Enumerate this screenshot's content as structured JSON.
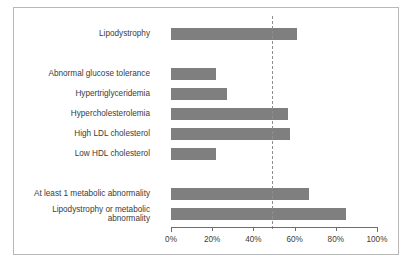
{
  "chart_data": {
    "type": "bar",
    "orientation": "horizontal",
    "title": "",
    "subtitle": "",
    "xlabel": "",
    "ylabel": "",
    "xlim": [
      0,
      100
    ],
    "grid": false,
    "legend": null,
    "units": "percent",
    "categories": [
      "Lipodystrophy",
      "Abnormal glucose tolerance",
      "Hypertriglyceridemia",
      "Hypercholesterolemia",
      "High LDL cholesterol",
      "Low HDL cholesterol",
      "At least 1 metabolic abnormality",
      "Lipodystrophy or metabolic abnormality"
    ],
    "values": [
      61,
      22,
      27,
      57,
      58,
      22,
      67,
      85
    ],
    "tick_labels": [
      "0%",
      "20%",
      "40%",
      "60%",
      "80%",
      "100%"
    ],
    "tick_values": [
      0,
      20,
      40,
      60,
      80,
      100
    ],
    "annotations": [
      {
        "name": "reference-line",
        "type": "vertical-dashed-line",
        "value": 49
      }
    ],
    "colors": {
      "bar": "#7f7f7f",
      "reference_line": "#8e8e8e",
      "axis": "#6e6e6e",
      "text": "#3b3b3b",
      "border": "#b8b8b8",
      "background": "#ffffff"
    }
  },
  "bars": [
    {
      "label": "Lipodystrophy",
      "value": 61,
      "group": 1
    },
    {
      "label": "Abnormal glucose tolerance",
      "value": 22,
      "group": 2
    },
    {
      "label": "Hypertriglyceridemia",
      "value": 27,
      "group": 2
    },
    {
      "label": "Hypercholesterolemia",
      "value": 57,
      "group": 2
    },
    {
      "label": "High LDL cholesterol",
      "value": 58,
      "group": 2
    },
    {
      "label": "Low HDL cholesterol",
      "value": 22,
      "group": 2
    },
    {
      "label": "At least 1 metabolic abnormality",
      "value": 67,
      "group": 3
    },
    {
      "label": "Lipodystrophy or metabolic\nabnormality",
      "value": 85,
      "group": 4
    }
  ],
  "axis": {
    "ticks": [
      {
        "label": "0%",
        "value": 0
      },
      {
        "label": "20%",
        "value": 20
      },
      {
        "label": "40%",
        "value": 40
      },
      {
        "label": "60%",
        "value": 60
      },
      {
        "label": "80%",
        "value": 80
      },
      {
        "label": "100%",
        "value": 100
      }
    ]
  }
}
